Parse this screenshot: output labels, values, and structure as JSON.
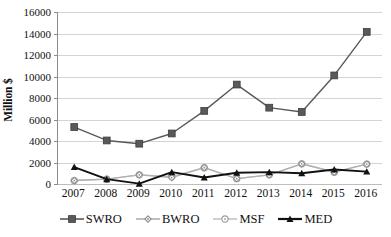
{
  "chart_data": {
    "type": "line",
    "title": "",
    "xlabel": "",
    "ylabel": "Million $",
    "categories": [
      "2007",
      "2008",
      "2009",
      "2010",
      "2011",
      "2012",
      "2013",
      "2014",
      "2015",
      "2016"
    ],
    "ylim": [
      0,
      16000
    ],
    "ytick_values": [
      0,
      2000,
      4000,
      6000,
      8000,
      10000,
      12000,
      14000,
      16000
    ],
    "ytick_labels": [
      "0",
      "2000",
      "4000",
      "6000",
      "8000",
      "10000",
      "12000",
      "14000",
      "16000"
    ],
    "grid": true,
    "legend_position": "bottom",
    "series": [
      {
        "name": "SWRO",
        "color": "#595959",
        "marker": "filled-square",
        "values": [
          5300,
          4050,
          3750,
          4700,
          6800,
          9250,
          7100,
          6700,
          10100,
          14150
        ]
      },
      {
        "name": "BWRO",
        "color": "#b0b0b0",
        "marker": "open-diamond",
        "values": [
          320,
          450,
          850,
          600,
          1520,
          500,
          850,
          1880,
          1100,
          1850
        ]
      },
      {
        "name": "MSF",
        "color": "#c4c4c4",
        "marker": "open-circle",
        "values": [
          320,
          450,
          850,
          700,
          1520,
          500,
          850,
          1880,
          1100,
          1850
        ]
      },
      {
        "name": "MED",
        "color": "#111111",
        "marker": "filled-triangle",
        "values": [
          1570,
          450,
          30,
          1100,
          600,
          1050,
          1100,
          1000,
          1350,
          1150
        ]
      }
    ]
  },
  "axes": {
    "y_title": "Million $"
  },
  "legend": {
    "items": [
      {
        "label": "SWRO"
      },
      {
        "label": "BWRO"
      },
      {
        "label": "MSF"
      },
      {
        "label": "MED"
      }
    ]
  }
}
